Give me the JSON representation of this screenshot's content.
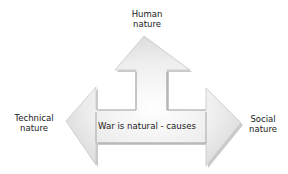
{
  "diagram": {
    "center_label": "War is natural - causes",
    "top_label_line1": "Human",
    "top_label_line2": "nature",
    "left_label_line1": "Technical",
    "left_label_line2": "nature",
    "right_label_line1": "Social",
    "right_label_line2": "nature",
    "arrow_fill": "#e6e6e6",
    "arrow_shadow": "#a8a8a8"
  }
}
